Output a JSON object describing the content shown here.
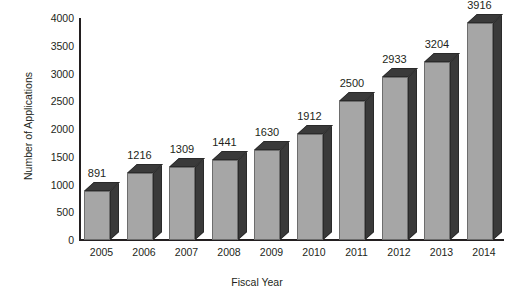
{
  "chart_data": {
    "type": "bar",
    "title": "",
    "xlabel": "Fiscal Year",
    "ylabel": "Number of Applications",
    "categories": [
      "2005",
      "2006",
      "2007",
      "2008",
      "2009",
      "2010",
      "2011",
      "2012",
      "2013",
      "2014"
    ],
    "values": [
      891,
      1216,
      1309,
      1441,
      1630,
      1912,
      2500,
      2933,
      3204,
      3916
    ],
    "data_labels": [
      "891",
      "1216",
      "1309",
      "1441",
      "1630",
      "1912",
      "2500",
      "2933",
      "3204",
      "3916"
    ],
    "ylim": [
      0,
      4000
    ],
    "ytick_labels": [
      "0",
      "500",
      "1000",
      "1500",
      "2000",
      "2500",
      "3000",
      "3500",
      "4000"
    ],
    "ytick_values": [
      0,
      500,
      1000,
      1500,
      2000,
      2500,
      3000,
      3500,
      4000
    ],
    "grid": false,
    "legend": false,
    "style": "3d-column",
    "colors": {
      "bar_front": "#a6a6a6",
      "bar_shade": "#3a3a3a",
      "axis": "#231f20",
      "background": "#ffffff",
      "text": "#231f20"
    }
  }
}
